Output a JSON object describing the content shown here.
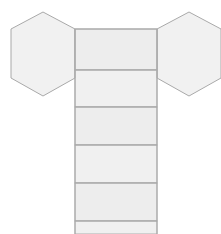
{
  "canvas": {
    "width": 221,
    "height": 234,
    "background": "#ffffff"
  },
  "header": {
    "clipped_caption": "figure: net of a hexagonal prism"
  },
  "style": {
    "face_fill": "#f0f0f0",
    "face_fill_alt": "#ededed",
    "stroke": "#a8a8a8",
    "stroke_light": "#bdbdbd",
    "stroke_width": 1
  },
  "diagram": {
    "name": "hexagonal-prism-net",
    "shape_type": "net",
    "solid": "hexagonal prism",
    "counts": {
      "hexagon_faces": 2,
      "rectangle_faces": 6,
      "total_faces": 8
    },
    "hexagons": [
      {
        "id": "hex-left",
        "label": "left hexagon face",
        "center_x": 43,
        "center_y": 54,
        "radius_x": 32,
        "radius_y": 42,
        "points": "43,12 75,29 75,78 43,96 11,78 11,29"
      },
      {
        "id": "hex-right",
        "label": "right hexagon face",
        "center_x": 189,
        "center_y": 54,
        "radius_x": 32,
        "radius_y": 42,
        "points": "189,12 221,29 221,78 189,96 157,78 157,29"
      }
    ],
    "strip": {
      "id": "lateral-strip",
      "label": "column of rectangular lateral faces",
      "x_left": 75,
      "x_right": 157,
      "y_top": 29,
      "y_bottom": 234,
      "dividers_y": [
        70,
        107,
        145,
        183,
        221
      ],
      "cells": [
        {
          "id": "rect-1",
          "label": "lateral face 1",
          "y_top": 29,
          "y_bottom": 70,
          "height": 41
        },
        {
          "id": "rect-2",
          "label": "lateral face 2",
          "y_top": 70,
          "y_bottom": 107,
          "height": 37
        },
        {
          "id": "rect-3",
          "label": "lateral face 3",
          "y_top": 107,
          "y_bottom": 145,
          "height": 38
        },
        {
          "id": "rect-4",
          "label": "lateral face 4",
          "y_top": 145,
          "y_bottom": 183,
          "height": 38
        },
        {
          "id": "rect-5",
          "label": "lateral face 5",
          "y_top": 183,
          "y_bottom": 221,
          "height": 38
        },
        {
          "id": "rect-6",
          "label": "lateral face 6 (clipped by bottom edge)",
          "y_top": 221,
          "y_bottom": 234,
          "height": 13
        }
      ]
    }
  }
}
